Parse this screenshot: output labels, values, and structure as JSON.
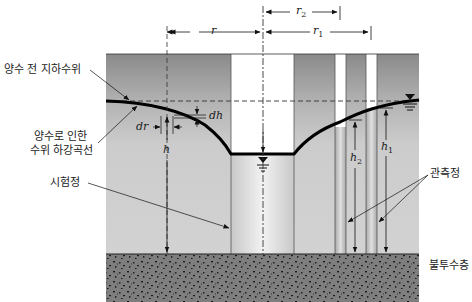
{
  "diagram": {
    "type": "unconfined-aquifer-pumping-test",
    "labels": {
      "original_water_table": "양수 전 지하수위",
      "drawdown_curve_line1": "양수로 인한",
      "drawdown_curve_line2": "수위 하강곡선",
      "test_well": "시험정",
      "observation_wells": "관측정",
      "impermeable_layer": "불투수층"
    },
    "variables": {
      "r": "r",
      "r1": "r",
      "r1_sub": "1",
      "r2": "r",
      "r2_sub": "2",
      "h": "h",
      "h1": "h",
      "h1_sub": "1",
      "h2": "h",
      "h2_sub": "2",
      "dh": "dh",
      "dr": "dr"
    },
    "colors": {
      "aquifer_top": "#8e8e8e",
      "aquifer_mid": "#c4c4c4",
      "aquifer_saturated": "#cfcfcf",
      "impermeable": "#7a7a7a",
      "well_bore": "#ffffff",
      "line": "#111111"
    }
  }
}
